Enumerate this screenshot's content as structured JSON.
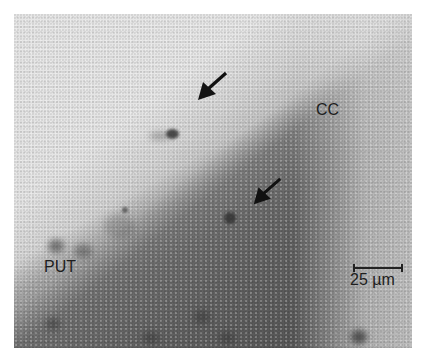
{
  "figure": {
    "type": "grayscale micrograph",
    "labels": {
      "cc": "CC",
      "put": "PUT"
    },
    "scale_bar": {
      "label": "25 µm"
    },
    "annotations": [
      {
        "type": "arrow",
        "direction": "down-left",
        "target": "upper labeled cell"
      },
      {
        "type": "arrow",
        "direction": "down-left",
        "target": "lower labeled cell"
      }
    ],
    "colors": {
      "light_region": "#e4e4e4",
      "dark_region": "#6e6e6e",
      "label_text": "#1e1e1e"
    }
  }
}
